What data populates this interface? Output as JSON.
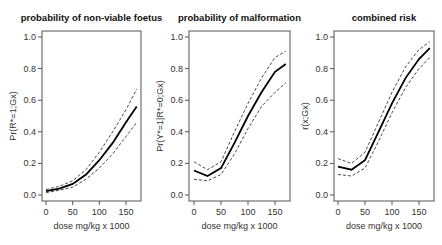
{
  "chart_data": [
    {
      "type": "line",
      "title": "probability of non-viable foetus",
      "xlabel": "dose mg/kg x 1000",
      "ylabel": "Pr(R*=1;Gx)",
      "xlim": [
        0,
        170
      ],
      "ylim": [
        0,
        1
      ],
      "xticks": [
        "0",
        "50",
        "100",
        "150"
      ],
      "yticks": [
        "0.0",
        "0.2",
        "0.4",
        "0.6",
        "0.8",
        "1.0"
      ],
      "grid": false,
      "x": [
        0,
        25,
        50,
        75,
        100,
        125,
        150,
        170
      ],
      "series": [
        {
          "name": "estimate",
          "style": "solid",
          "values": [
            0.025,
            0.04,
            0.07,
            0.13,
            0.22,
            0.33,
            0.46,
            0.56
          ]
        },
        {
          "name": "upper bound",
          "style": "dashed",
          "values": [
            0.035,
            0.055,
            0.09,
            0.16,
            0.27,
            0.4,
            0.54,
            0.67
          ]
        },
        {
          "name": "lower bound",
          "style": "dashed",
          "values": [
            0.015,
            0.03,
            0.05,
            0.1,
            0.17,
            0.26,
            0.37,
            0.46
          ]
        }
      ]
    },
    {
      "type": "line",
      "title": "probability of malformation",
      "xlabel": "dose mg/kg x 1000",
      "ylabel": "Pr(Y*=1|R*=0;Gx)",
      "xlim": [
        0,
        170
      ],
      "ylim": [
        0,
        1
      ],
      "xticks": [
        "0",
        "50",
        "100",
        "150"
      ],
      "yticks": [
        "0.0",
        "0.2",
        "0.4",
        "0.6",
        "0.8",
        "1.0"
      ],
      "grid": false,
      "x": [
        0,
        25,
        50,
        75,
        100,
        125,
        150,
        170
      ],
      "series": [
        {
          "name": "estimate",
          "style": "solid",
          "values": [
            0.155,
            0.12,
            0.17,
            0.33,
            0.5,
            0.65,
            0.78,
            0.83
          ]
        },
        {
          "name": "upper bound",
          "style": "dashed",
          "values": [
            0.21,
            0.16,
            0.21,
            0.4,
            0.58,
            0.74,
            0.87,
            0.91
          ]
        },
        {
          "name": "lower bound",
          "style": "dashed",
          "values": [
            0.1,
            0.09,
            0.13,
            0.26,
            0.42,
            0.56,
            0.65,
            0.71
          ]
        }
      ]
    },
    {
      "type": "line",
      "title": "combined risk",
      "xlabel": "dose mg/kg x 1000",
      "ylabel": "r(x;Gx)",
      "xlim": [
        0,
        170
      ],
      "ylim": [
        0,
        1
      ],
      "xticks": [
        "0",
        "50",
        "100",
        "150"
      ],
      "yticks": [
        "0.0",
        "0.2",
        "0.4",
        "0.6",
        "0.8",
        "1.0"
      ],
      "grid": false,
      "x": [
        0,
        25,
        50,
        75,
        100,
        125,
        150,
        170
      ],
      "series": [
        {
          "name": "estimate",
          "style": "solid",
          "values": [
            0.18,
            0.16,
            0.22,
            0.4,
            0.58,
            0.74,
            0.86,
            0.93
          ]
        },
        {
          "name": "upper bound",
          "style": "dashed",
          "values": [
            0.23,
            0.2,
            0.27,
            0.46,
            0.65,
            0.81,
            0.92,
            0.97
          ]
        },
        {
          "name": "lower bound",
          "style": "dashed",
          "values": [
            0.13,
            0.12,
            0.17,
            0.34,
            0.52,
            0.68,
            0.8,
            0.87
          ]
        }
      ]
    }
  ]
}
